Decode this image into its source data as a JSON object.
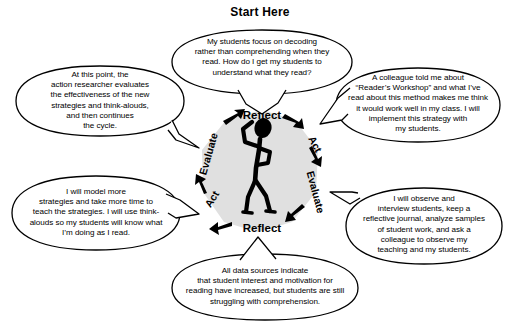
{
  "title": "Start Here",
  "center": {
    "figure_icon": "stick-figure-person-thinking-icon",
    "cycle_labels": [
      {
        "id": "reflect-top",
        "text": "Reflect"
      },
      {
        "id": "act-right-upper",
        "text": "Act"
      },
      {
        "id": "evaluate-right-lower",
        "text": "Evaluate"
      },
      {
        "id": "reflect-bottom",
        "text": "Reflect"
      },
      {
        "id": "act-left-lower",
        "text": "Act"
      },
      {
        "id": "evaluate-left-upper",
        "text": "Evaluate"
      }
    ],
    "fill_color": "#e0e0e0",
    "stroke_color": "#000000"
  },
  "bubbles": [
    {
      "id": "top-question",
      "text": "My students focus on decoding\nrather than comprehending when they\nread.  How do I get my students to\nunderstand what they read?"
    },
    {
      "id": "left-upper-evaluate",
      "text": "At this point, the\naction researcher evaluates\nthe effectiveness of the new\nstrategies and think-alouds,\nand then continues\nthe cycle."
    },
    {
      "id": "right-upper-act",
      "text": "A colleague told me about\n“Reader’s Workshop” and what I’ve\nread about this method makes me think\nit would work well in my class.  I will\nimplement this strategy with\nmy students."
    },
    {
      "id": "right-lower-evaluate",
      "text": "I will observe and\ninterview students, keep a\nreflective journal, analyze samples\nof student work, and ask a\ncolleague to observe my\nteaching and my students."
    },
    {
      "id": "bottom-reflect",
      "text": "All data sources indicate\nthat student interest and motivation for\nreading have increased, but students are still\nstruggling with comprehension."
    },
    {
      "id": "left-lower-act",
      "text": "I will model more\nstrategies and take more time to\nteach the strategies.  I will use think-\nalouds so my students will know what\nI’m doing as I read."
    }
  ]
}
